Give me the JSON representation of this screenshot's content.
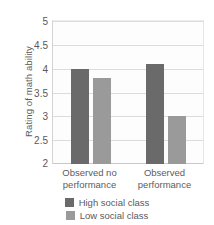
{
  "chart_data": {
    "type": "bar",
    "title": "",
    "subtitle": "",
    "xlabel": "",
    "ylabel": "Rating of math ability",
    "categories": [
      "Observed no performance",
      "Observed performance"
    ],
    "category_lines": [
      [
        "Observed no",
        "performance"
      ],
      [
        "Observed",
        "performance"
      ]
    ],
    "series": [
      {
        "name": "High social class",
        "color": "#6a6a6a",
        "values": [
          4.0,
          4.1
        ]
      },
      {
        "name": "Low social class",
        "color": "#9a9a9a",
        "values": [
          3.8,
          3.0
        ]
      }
    ],
    "ylim": [
      2,
      5
    ],
    "yticks": [
      5,
      4.5,
      4,
      3.5,
      3,
      2.5,
      2
    ],
    "ytick_labels": [
      "5",
      "4.5",
      "4",
      "3.5",
      "3",
      "2.5",
      "2"
    ],
    "grid": true,
    "grid_color": "#dcdcde",
    "legend_position": "bottom-center",
    "plot_background": "#fdfdfd"
  }
}
